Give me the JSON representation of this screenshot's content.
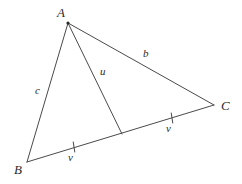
{
  "figure": {
    "type": "geometry-diagram",
    "canvas": {
      "width": 242,
      "height": 184,
      "background": "#ffffff"
    },
    "stroke_color": "#4a4a4a",
    "text_color": "#2b2b2b",
    "points": {
      "A": {
        "label": "A",
        "x": 68,
        "y": 23,
        "label_x": 57,
        "label_y": 6
      },
      "B": {
        "label": "B",
        "x": 27,
        "y": 162,
        "label_x": 14,
        "label_y": 163
      },
      "C": {
        "label": "C",
        "x": 214,
        "y": 105,
        "label_x": 221,
        "label_y": 99
      },
      "M": {
        "label": "",
        "x": 122,
        "y": 134
      }
    },
    "segments": [
      {
        "name": "side-ab",
        "from": "A",
        "to": "B"
      },
      {
        "name": "side-ac",
        "from": "A",
        "to": "C"
      },
      {
        "name": "side-bc",
        "from": "B",
        "to": "C"
      },
      {
        "name": "median-am",
        "from": "A",
        "to": "M"
      }
    ],
    "labels": {
      "side_c": {
        "text": "c",
        "x": 35,
        "y": 85
      },
      "side_b": {
        "text": "b",
        "x": 143,
        "y": 48
      },
      "median_u": {
        "text": "u",
        "x": 100,
        "y": 66
      },
      "half_bm_v": {
        "text": "v",
        "x": 68,
        "y": 152
      },
      "half_mc_v": {
        "text": "v",
        "x": 166,
        "y": 123
      }
    },
    "tick_marks": [
      {
        "name": "tick-bm",
        "x": 74,
        "y": 147,
        "angle_deg": -9,
        "length": 11
      },
      {
        "name": "tick-mc",
        "x": 172,
        "y": 118,
        "angle_deg": -9,
        "length": 11
      }
    ]
  }
}
